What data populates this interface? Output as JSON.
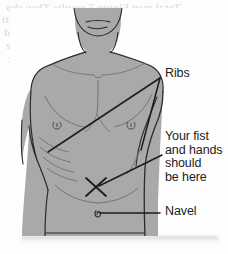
{
  "figure": {
    "body_fill": "#a9a9a9",
    "outline_color": "#2b2b2b",
    "background": "#fefefe",
    "label_text_color": "#1c1c1c"
  },
  "labels": [
    {
      "id": "ribs",
      "text": "Ribs",
      "leader": "diagonal-line-to-lower-left-rib-margin"
    },
    {
      "id": "fist",
      "text": "Your fist\nand hands\nshould\nbe here",
      "leader": "line-to-x-mark"
    },
    {
      "id": "navel",
      "text": "Navel",
      "leader": "horizontal-line-to-navel"
    }
  ],
  "markers": [
    {
      "id": "x-mark",
      "symbol": "X",
      "meaning": "hand placement position",
      "x": 96,
      "y": 187
    },
    {
      "id": "navel-mark",
      "symbol": "navel",
      "x": 98,
      "y": 214
    }
  ],
  "bleed_through_text": [
    "Total men  Figure 5 results  They sho",
    "for the patient and measured a pati",
    "minute. A person is able to accord",
    "ase. If this condition persists, urge",
    "in a week, then call for the doc",
    "hearth and the patients are well an",
    "of the patient who are admitted to",
    "and they will be moved here if"
  ]
}
